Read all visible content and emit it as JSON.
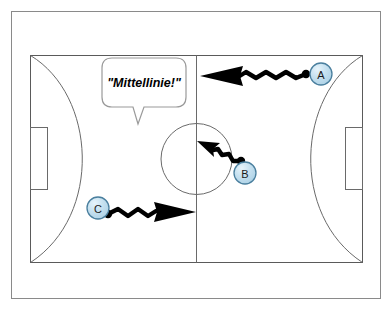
{
  "diagram": {
    "frame": {
      "border_color": "#8a8a8a",
      "background_color": "#ffffff"
    },
    "court": {
      "line_color": "#5a5a5a",
      "center_line_label": "center-line",
      "center_circle_label": "center-circle",
      "left_goal_label": "left-goal",
      "right_goal_label": "right-goal",
      "left_goal_area_label": "left-goal-area-arc",
      "right_goal_area_label": "right-goal-area-arc"
    },
    "speech_bubble": {
      "text": "\"Mittellinie!\"",
      "outline_color": "#9a9a9a",
      "fill_color": "#ffffff"
    },
    "players": [
      {
        "id": "A",
        "label": "A",
        "cx": 321,
        "cy": 74,
        "r": 11,
        "fill": "#bcdcee",
        "stroke": "#4a7f9e",
        "movement": "runs left toward the centre line",
        "arrow": {
          "from_x": 307,
          "from_y": 74,
          "to_x": 201,
          "to_y": 76,
          "color": "#000000"
        }
      },
      {
        "id": "B",
        "label": "B",
        "cx": 245,
        "cy": 173,
        "r": 11,
        "fill": "#bcdcee",
        "stroke": "#4a7f9e",
        "movement": "runs up-left into the centre circle",
        "arrow": {
          "from_x": 240,
          "from_y": 160,
          "to_x": 198,
          "to_y": 144,
          "color": "#000000"
        }
      },
      {
        "id": "C",
        "label": "C",
        "cx": 98,
        "cy": 208,
        "r": 11,
        "fill": "#bcdcee",
        "stroke": "#4a7f9e",
        "movement": "runs right toward the centre line",
        "arrow": {
          "from_x": 108,
          "from_y": 214,
          "to_x": 195,
          "to_y": 213,
          "color": "#000000"
        }
      }
    ],
    "colors": {
      "player_fill": "#bcdcee",
      "player_stroke": "#4a7f9e",
      "arrow": "#000000",
      "court_line": "#5a5a5a",
      "frame": "#8a8a8a"
    }
  }
}
